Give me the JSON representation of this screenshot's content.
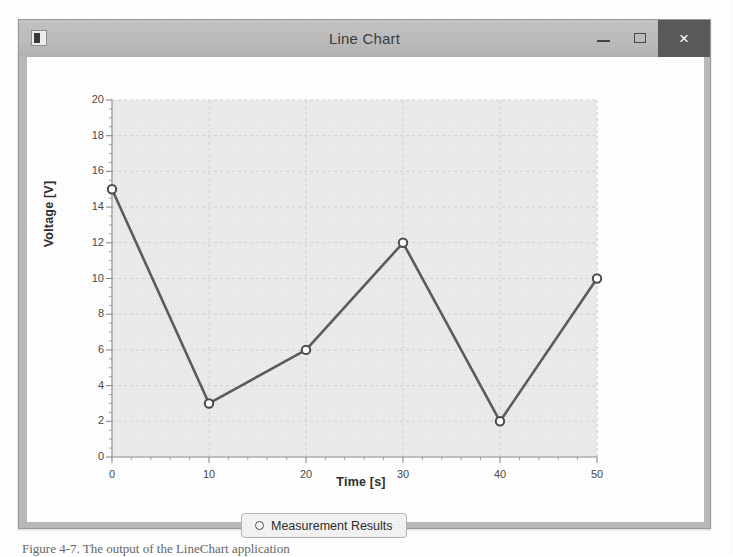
{
  "window": {
    "title": "Line Chart",
    "app_icon": "application-icon",
    "controls": {
      "minimize_label": "–",
      "maximize_label": "□",
      "close_label": "×"
    }
  },
  "legend": {
    "marker": "circle-marker",
    "label": "Measurement Results"
  },
  "caption": {
    "text": "Figure 4-7.  The output of the LineChart application"
  },
  "colors": {
    "titlebar": "#bcbcbc",
    "close_button": "#5a5a5a",
    "window_frame": "#b9b9b9",
    "plot_background": "#ebebeb",
    "series_line": "#5c5c5c",
    "marker_fill": "#ffffff",
    "marker_stroke": "#4a4a4a",
    "gridline": "#d2d2d2",
    "axis": "#8a8a8a"
  },
  "chart_data": {
    "type": "line",
    "title": "Line Chart",
    "xlabel": "Time [s]",
    "ylabel": "Voltage [V]",
    "xlim": [
      0,
      50
    ],
    "ylim": [
      0,
      20
    ],
    "x_major_tick": 10,
    "x_minor_tick": 2,
    "y_major_tick": 2,
    "y_minor_tick": 0.5,
    "grid": true,
    "legend_position": "bottom",
    "x_tick_labels": [
      "0",
      "10",
      "20",
      "30",
      "40",
      "50"
    ],
    "y_tick_labels": [
      "0",
      "2",
      "4",
      "6",
      "8",
      "10",
      "12",
      "14",
      "16",
      "18",
      "20"
    ],
    "series": [
      {
        "name": "Measurement Results",
        "marker": "circle",
        "x": [
          0,
          10,
          20,
          30,
          40,
          50
        ],
        "values": [
          15,
          3,
          6,
          12,
          2,
          10
        ]
      }
    ]
  }
}
